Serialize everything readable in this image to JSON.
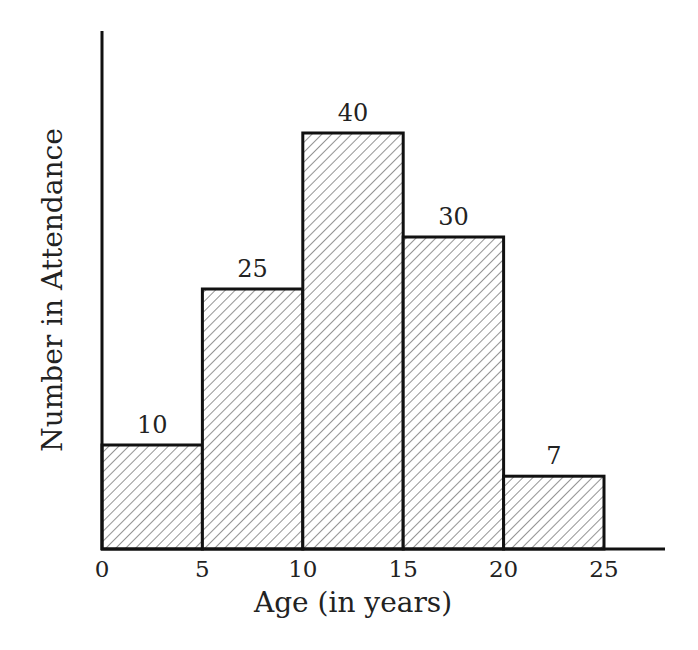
{
  "chart_data": {
    "type": "bar",
    "subtype": "histogram",
    "title": "",
    "xlabel": "Age (in years)",
    "ylabel": "Number in Attendance",
    "bins": [
      [
        0,
        5
      ],
      [
        5,
        10
      ],
      [
        10,
        15
      ],
      [
        15,
        20
      ],
      [
        20,
        25
      ]
    ],
    "categories": [
      "0-5",
      "5-10",
      "10-15",
      "15-20",
      "20-25"
    ],
    "values": [
      10,
      25,
      40,
      30,
      7
    ],
    "data_labels": [
      "10",
      "25",
      "40",
      "30",
      "7"
    ],
    "x_ticks": [
      "0",
      "5",
      "10",
      "15",
      "20",
      "25"
    ],
    "xlim": [
      0,
      28
    ],
    "ylim": [
      0,
      50
    ],
    "y_ticks_shown": false,
    "grid": false,
    "legend": null,
    "bar_fill": "diagonal hatch",
    "colors": {
      "bar_edge": "#111111",
      "hatch": "#555555",
      "background": "#ffffff"
    }
  }
}
